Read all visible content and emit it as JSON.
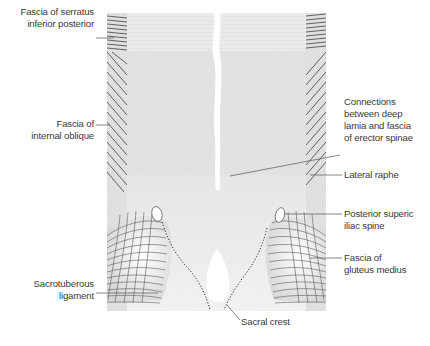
{
  "figure": {
    "colors": {
      "background": "#ffffff",
      "fascia_fill": "#e4e4e4",
      "fascia_light": "#f1f1f1",
      "hatch_line": "#4a4a4a",
      "label_text": "#3a3a3a",
      "leader_line": "#555555",
      "dotted_crest": "#333333"
    }
  },
  "labels": {
    "left": [
      {
        "lines": [
          "Fascia of serratus",
          "inferior posterior"
        ]
      },
      {
        "lines": [
          "Fascia of",
          "internal oblique"
        ]
      },
      {
        "lines": [
          "Sacrotuberous",
          "ligament"
        ]
      }
    ],
    "right": [
      {
        "lines": [
          "Connections",
          "between deep",
          "lamia and fascia",
          "of erector spinae"
        ]
      },
      {
        "lines": [
          "Lateral raphe"
        ]
      },
      {
        "lines": [
          "Posterior superic",
          "iliac spine"
        ]
      },
      {
        "lines": [
          "Fascia of",
          "gluteus medius"
        ]
      }
    ],
    "bottom": [
      {
        "lines": [
          "Sacral crest"
        ]
      }
    ]
  }
}
